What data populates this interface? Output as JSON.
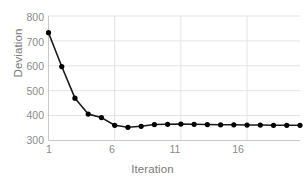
{
  "chart_data": {
    "type": "line",
    "title": "",
    "subtitle": "",
    "xlabel": "Iteration",
    "ylabel": "Deviation",
    "xlim": [
      1,
      20
    ],
    "ylim": [
      300,
      800
    ],
    "xticks": [
      1,
      6,
      11,
      16
    ],
    "yticks": [
      300,
      400,
      500,
      600,
      700,
      800
    ],
    "grid": "horizontal-and-vertical-light",
    "legend": "none",
    "marker": "filled-circle",
    "line_color": "#1a1a1a",
    "marker_color": "#000000",
    "grid_color": "#e3e3e3",
    "axis_color": "#d0d0d0",
    "tick_label_color": "#8a8a8a",
    "x": [
      1,
      2,
      3,
      4,
      5,
      6,
      7,
      8,
      9,
      10,
      11,
      12,
      13,
      14,
      15,
      16,
      17,
      18,
      19,
      20
    ],
    "values": [
      733,
      597,
      470,
      406,
      392,
      361,
      353,
      357,
      364,
      365,
      366,
      365,
      364,
      363,
      363,
      362,
      362,
      361,
      361,
      361
    ],
    "series": [
      {
        "name": "Deviation",
        "values": [
          733,
          597,
          470,
          406,
          392,
          361,
          353,
          357,
          364,
          365,
          366,
          365,
          364,
          363,
          363,
          362,
          362,
          361,
          361,
          361
        ]
      }
    ]
  },
  "axes": {
    "y_title": "Deviation",
    "x_title": "Iteration",
    "y_tick_labels": [
      "800",
      "700",
      "600",
      "500",
      "400",
      "300"
    ],
    "x_tick_labels": [
      "1",
      "6",
      "11",
      "16"
    ]
  }
}
